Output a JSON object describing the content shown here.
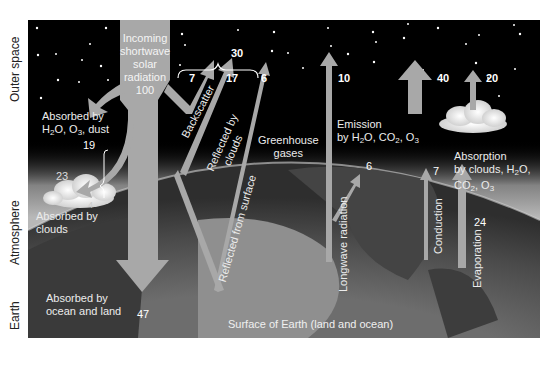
{
  "side_labels": {
    "outer_space": "Outer space",
    "atmosphere": "Atmosphere",
    "earth": "Earth"
  },
  "incoming": {
    "line1": "Incoming",
    "line2": "shortwave",
    "line3": "solar",
    "line4": "radiation",
    "value": "100"
  },
  "shortwave": {
    "absorbed_h2o_line1": "Absorbed by",
    "absorbed_h2o_line2": "H2O, O3, dust",
    "absorbed_h2o_value": "19",
    "absorbed_clouds_line1": "Absorbed by",
    "absorbed_clouds_line2": "clouds",
    "absorbed_clouds_value": "4",
    "atmosphere_total": "23",
    "backscatter_label": "Backscatter",
    "backscatter_value": "7",
    "reflected_clouds_line1": "Reflected by",
    "reflected_clouds_line2": "clouds",
    "reflected_clouds_value": "17",
    "reflected_surface_label": "Reflected from surface",
    "reflected_surface_value": "6",
    "albedo_total": "30",
    "absorbed_surface_line1": "Absorbed by",
    "absorbed_surface_line2": "ocean and land",
    "absorbed_surface_value": "47"
  },
  "longwave": {
    "greenhouse_line1": "Greenhouse",
    "greenhouse_line2": "gases",
    "longwave_label": "Longwave radiation",
    "longwave_space_value": "10",
    "longwave_atm_value": "6",
    "emission_line1": "Emission",
    "emission_line2": "by H2O, CO2, O3",
    "emission_value": "40",
    "cloud_emission_value": "20",
    "conduction_label": "Conduction",
    "conduction_value": "7",
    "evaporation_label": "Evaporation",
    "evaporation_value": "24",
    "absorption_line1": "Absorption",
    "absorption_line2": "by clouds, H2O,",
    "absorption_line3": "CO2, O3"
  },
  "surface_label": "Surface of Earth (land and ocean)",
  "colors": {
    "arrow": "#a8a8a8",
    "space": "#000000",
    "text": "#ececec"
  }
}
